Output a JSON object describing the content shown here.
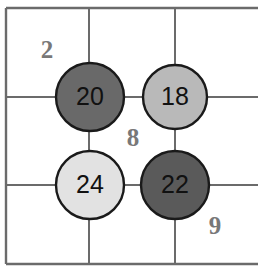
{
  "figure": {
    "type": "grid-node-diagram",
    "background_color": "#ffffff",
    "grid_line_color": "#6b6b6b",
    "node_outline_color": "#1a1a1a",
    "node_label_color": "#111111",
    "cell_label_color": "#787878"
  },
  "grid": {
    "border": {
      "x": 6,
      "y": 8,
      "width": 252,
      "height": 256
    },
    "vertical_lines": [
      89,
      175
    ],
    "horizontal_lines": [
      97,
      185
    ]
  },
  "nodes": [
    {
      "id": "node-20",
      "label": "20",
      "cx": 90,
      "cy": 97,
      "r": 34,
      "fill": "#696969"
    },
    {
      "id": "node-18",
      "label": "18",
      "cx": 175,
      "cy": 97,
      "r": 32,
      "fill": "#b9b9b9"
    },
    {
      "id": "node-24",
      "label": "24",
      "cx": 90,
      "cy": 185,
      "r": 34,
      "fill": "#e2e2e2"
    },
    {
      "id": "node-22",
      "label": "22",
      "cx": 175,
      "cy": 185,
      "r": 34,
      "fill": "#5a5a5a"
    }
  ],
  "cell_labels": [
    {
      "id": "cell-label-2",
      "text": "2",
      "x": 47,
      "y": 52
    },
    {
      "id": "cell-label-8",
      "text": "8",
      "x": 133,
      "y": 140
    },
    {
      "id": "cell-label-9",
      "text": "9",
      "x": 215,
      "y": 228
    }
  ],
  "chart_data": {
    "type": "table",
    "title": "",
    "xlabel": "",
    "ylabel": "",
    "categories": [
      "20",
      "18",
      "24",
      "22"
    ],
    "values": [
      20,
      18,
      24,
      22
    ],
    "annotations": [
      "2",
      "8",
      "9"
    ]
  }
}
